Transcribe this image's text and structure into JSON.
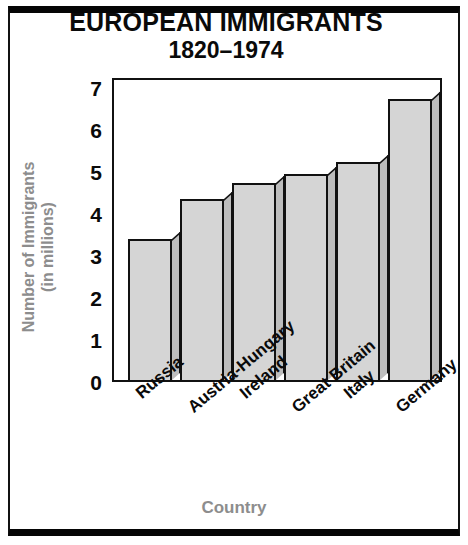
{
  "chart_data": {
    "type": "bar",
    "title": "EUROPEAN IMMIGRANTS",
    "subtitle": "1820–1974",
    "xlabel": "Country",
    "ylabel_line1": "Number of Immigrants",
    "ylabel_line2": "(in millions)",
    "categories": [
      "Russia",
      "Austria-Hungary",
      "Ireland",
      "Great Britain",
      "Italy",
      "Germany"
    ],
    "values": [
      3.35,
      4.3,
      4.7,
      4.9,
      5.2,
      6.7
    ],
    "ylim": [
      0,
      7
    ],
    "ytick_labels": [
      "0",
      "1",
      "2",
      "3",
      "4",
      "5",
      "6",
      "7"
    ],
    "ytick_values": [
      0,
      1,
      2,
      3,
      4,
      5,
      6,
      7
    ],
    "yminor_values": [
      0.5,
      1.5,
      2.5,
      3.5,
      4.5,
      5.5,
      6.5
    ],
    "grid": false,
    "legend": "none",
    "colors": {
      "bar_face": "#d5d5d5",
      "bar_side": "#bdbdbd",
      "outline": "#111111",
      "axis_label": "#8d8d8d",
      "text": "#0a0a0a",
      "background": "#ffffff"
    }
  }
}
